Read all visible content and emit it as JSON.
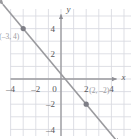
{
  "chart_data": {
    "type": "line",
    "title": "",
    "xlabel": "x",
    "ylabel": "y",
    "xlim": [
      -5.2,
      5.2
    ],
    "ylim": [
      -5.0,
      4.8
    ],
    "grid": true,
    "grid_step": 1,
    "legend": "none",
    "x_ticks": [
      -4,
      -2,
      0,
      2,
      4
    ],
    "x_tick_labels": [
      "–4",
      "–2",
      "0",
      "2",
      "4"
    ],
    "y_ticks": [
      4,
      2,
      -2,
      -4
    ],
    "y_tick_labels": [
      "4",
      "2",
      "–2",
      "–4"
    ],
    "series": [
      {
        "name": "line",
        "slope": -1.2,
        "intercept": 0.4,
        "x": [
          -4.6,
          4.6
        ],
        "y": [
          5.92,
          -5.12
        ],
        "arrows": "both",
        "color": "#9a9a9e"
      }
    ],
    "points": [
      {
        "label": "(–3, 4)",
        "x": -3,
        "y": 4,
        "label_dx": -1.9,
        "label_dy": -0.85
      },
      {
        "label": "(2, –2)",
        "x": 2,
        "y": -2,
        "label_dx": 0.25,
        "label_dy": 0.85
      }
    ],
    "colors": {
      "grid": "#d8d9e0",
      "axis": "#9a9a9e",
      "line": "#9a9a9e",
      "point": "#7e7e86",
      "tick_text": "#58585a",
      "point_text": "#a3a3a8",
      "background": "#ffffff"
    }
  },
  "axes": {
    "x_axis_name": "x",
    "y_axis_name": "y"
  }
}
